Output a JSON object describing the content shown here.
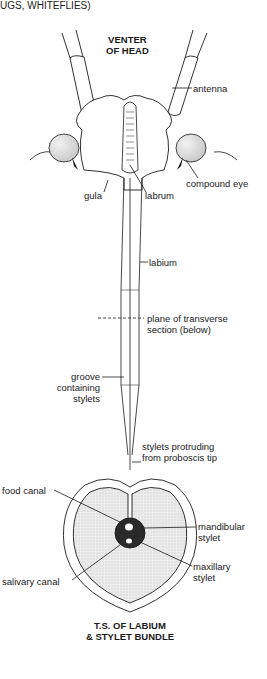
{
  "header": {
    "caption_fragment": "UGS, WHITEFLIES)"
  },
  "head_view": {
    "title_line1": "VENTER",
    "title_line2": "OF HEAD",
    "labels": {
      "antenna": "antenna",
      "compound_eye": "compound eye",
      "gula": "gula",
      "labrum": "labrum",
      "labium": "labium",
      "plane_line1": "plane of transverse",
      "plane_line2": "section (below)",
      "groove_line1": "groove",
      "groove_line2": "containing",
      "groove_line3": "stylets",
      "stylets_line1": "stylets protruding",
      "stylets_line2": "from proboscis tip"
    }
  },
  "cross_section": {
    "labels": {
      "food_canal": "food canal",
      "mandibular_line1": "mandibular",
      "mandibular_line2": "stylet",
      "maxillary_line1": "maxillary",
      "maxillary_line2": "stylet",
      "salivary_canal": "salivary canal"
    },
    "title_line1": "T.S. OF LABIUM",
    "title_line2": "& STYLET BUNDLE"
  },
  "colors": {
    "ink": "#1a1a1a",
    "stipple": "#e4e4e4",
    "eye": "#dcdcdc",
    "bundle": "#2a2a2a"
  }
}
